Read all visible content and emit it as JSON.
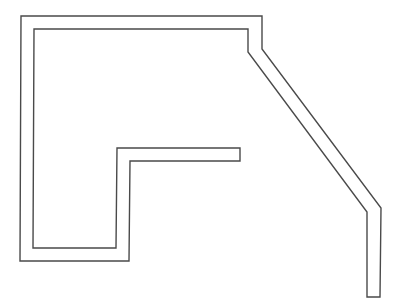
{
  "diagram": {
    "type": "wall-outline",
    "stroke_color": "#4a4a4a",
    "background": "#ffffff",
    "outer_path": [
      [
        21,
        16
      ],
      [
        262,
        16
      ],
      [
        262,
        49
      ],
      [
        381,
        208
      ],
      [
        380,
        297
      ],
      [
        367,
        297
      ],
      [
        367,
        212
      ],
      [
        248,
        52
      ],
      [
        248,
        29
      ],
      [
        34,
        29
      ],
      [
        33,
        248
      ],
      [
        116,
        248
      ],
      [
        117,
        148
      ],
      [
        240,
        148
      ],
      [
        240,
        161
      ],
      [
        130,
        161
      ],
      [
        129,
        261
      ],
      [
        20,
        261
      ]
    ],
    "points_string": "21,16 262,16 262,49 381,208 380,297 367,297 367,212 248,52 248,29 34,29 33,248 116,248 117,148 240,148 240,161 130,161 129,261 20,261"
  }
}
